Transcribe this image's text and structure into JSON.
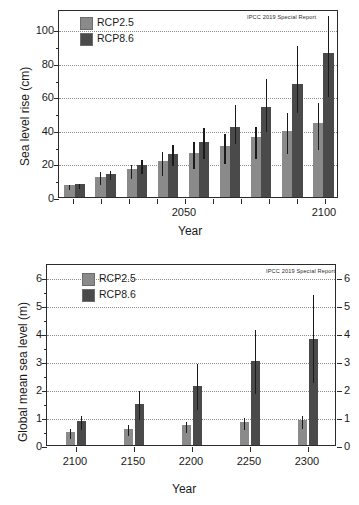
{
  "figure": {
    "width": 359,
    "height": 505,
    "colors": {
      "rcp25": "#8a8a8a",
      "rcp86": "#4a4a4a",
      "axis": "#2b2b2b",
      "grid": "#8d8d8d",
      "background": "#ffffff"
    }
  },
  "chart_data": [
    {
      "id": "top",
      "type": "bar",
      "title": "",
      "annotation": "IPCC 2019  Special Report",
      "xlabel": "Year",
      "ylabel": "Sea level rise (cm)",
      "ylim": [
        0,
        112
      ],
      "yticks": [
        0,
        20,
        40,
        60,
        80,
        100
      ],
      "yticklabels": [
        "0",
        "20",
        "40",
        "60",
        "80",
        "100"
      ],
      "grid": true,
      "legend_position": "upper-left",
      "xlim": [
        2005,
        2105
      ],
      "xticks": [
        2010,
        2020,
        2030,
        2040,
        2050,
        2060,
        2070,
        2080,
        2090,
        2100
      ],
      "xticklabels": [
        "",
        "",
        "",
        "",
        "2050",
        "",
        "",
        "",
        "",
        "2100"
      ],
      "categories": [
        2010,
        2020,
        2030,
        2040,
        2050,
        2060,
        2070,
        2080,
        2090
      ],
      "series": [
        {
          "name": "RCP2.5",
          "values": [
            7,
            12,
            16.5,
            21.5,
            26,
            30.5,
            35.5,
            39.5,
            44
          ],
          "err_low": [
            5.5,
            8.5,
            12,
            14,
            18,
            21,
            24,
            27,
            29.5
          ],
          "err_high": [
            8.5,
            16,
            20.5,
            28,
            34,
            38.5,
            43,
            51.5,
            57.5
          ]
        },
        {
          "name": "RCP8.6",
          "values": [
            7.5,
            13.5,
            19,
            25.5,
            33,
            42,
            53.5,
            67.5,
            86
          ],
          "err_low": [
            6,
            11,
            15,
            19.5,
            24,
            32.5,
            40,
            51.5,
            60.5
          ],
          "err_high": [
            9,
            16.5,
            23,
            32,
            42.5,
            56,
            71.5,
            91,
            109
          ]
        }
      ]
    },
    {
      "id": "bottom",
      "type": "bar",
      "title": "",
      "annotation": "IPCC 2019  Special Report",
      "xlabel": "Year",
      "ylabel": "Global mean sea level (m)",
      "ylim": [
        0,
        6.5
      ],
      "yticks": [
        0,
        1,
        2,
        3,
        4,
        5,
        6
      ],
      "yticklabels": [
        "0",
        "1",
        "2",
        "3",
        "4",
        "5",
        "6"
      ],
      "right_axis": true,
      "right_yticklabels": [
        "0",
        "1",
        "2",
        "3",
        "4",
        "5",
        "6"
      ],
      "grid": true,
      "legend_position": "upper-left",
      "categories": [
        "2100",
        "2150",
        "2200",
        "2250",
        "2300"
      ],
      "series": [
        {
          "name": "RCP2.5",
          "values": [
            0.45,
            0.58,
            0.7,
            0.82,
            0.9
          ],
          "err_low": [
            0.3,
            0.4,
            0.5,
            0.6,
            0.65
          ],
          "err_high": [
            0.65,
            0.78,
            0.9,
            1.03,
            1.1
          ]
        },
        {
          "name": "RCP8.6",
          "values": [
            0.87,
            1.47,
            2.12,
            3.0,
            3.77
          ],
          "err_low": [
            0.62,
            0.95,
            1.33,
            1.88,
            2.3
          ],
          "err_high": [
            1.1,
            2.0,
            2.95,
            4.17,
            5.43
          ]
        }
      ]
    }
  ],
  "legend": {
    "items": [
      {
        "label": "RCP2.5",
        "color_key": "rcp25"
      },
      {
        "label": "RCP8.6",
        "color_key": "rcp86"
      }
    ]
  }
}
